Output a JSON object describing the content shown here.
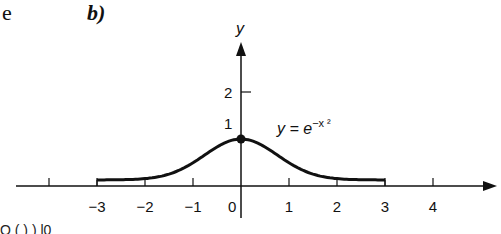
{
  "page": {
    "left_fragment": "e",
    "panel_label": "b)",
    "bottom_fragment": "Q   ( ) )           l0"
  },
  "chart_data": {
    "type": "line",
    "title": "",
    "xlabel": "",
    "ylabel": "y",
    "curve_label": "y = e^{-x^2}",
    "curve_label_display": "y = e",
    "curve_label_exponent": "−x ²",
    "x_ticks": [
      -4,
      -3,
      -2,
      -1,
      0,
      1,
      2,
      3,
      4
    ],
    "x_tick_labels": [
      "",
      "−3",
      "−2",
      "−1",
      "0",
      "1",
      "2",
      "3",
      "4"
    ],
    "y_ticks": [
      1,
      2
    ],
    "y_tick_labels": [
      "1",
      "2"
    ],
    "xlim": [
      -4.5,
      5.3
    ],
    "ylim": [
      0,
      3
    ],
    "grid": false,
    "highlighted_point": {
      "x": 0,
      "y": 1
    },
    "series": [
      {
        "name": "y = e^(-x^2)",
        "domain": [
          -3,
          3
        ],
        "x": [
          -3,
          -2.5,
          -2,
          -1.5,
          -1,
          -0.5,
          0,
          0.5,
          1,
          1.5,
          2,
          2.5,
          3
        ],
        "values": [
          0.0001,
          0.0019,
          0.0183,
          0.1054,
          0.3679,
          0.7788,
          1.0,
          0.7788,
          0.3679,
          0.1054,
          0.0183,
          0.0019,
          0.0001
        ]
      }
    ]
  }
}
